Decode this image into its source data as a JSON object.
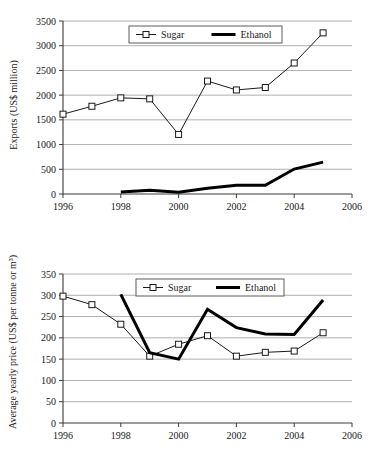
{
  "figure": {
    "title": "",
    "charts": [
      {
        "id": "exports",
        "name": "Sugar and ethanol exports"
      },
      {
        "id": "prices",
        "name": "Sugar and ethanol average yearly price"
      }
    ]
  },
  "chart_data": [
    {
      "type": "line",
      "title": "",
      "xlabel": "",
      "ylabel": "Exports (US$ million)",
      "x": [
        1996,
        1997,
        1998,
        1999,
        2000,
        2001,
        2002,
        2003,
        2004,
        2005
      ],
      "xlim": [
        1996,
        2006
      ],
      "ylim": [
        0,
        3500
      ],
      "xticks": [
        1996,
        1998,
        2000,
        2002,
        2004,
        2006
      ],
      "xticklabels": [
        "1996",
        "1998",
        "2000",
        "2002",
        "2004",
        "2006"
      ],
      "yticks": [
        0,
        500,
        1000,
        1500,
        2000,
        2500,
        3000,
        3500
      ],
      "yticklabels": [
        "0",
        "500",
        "1000",
        "1500",
        "2000",
        "2500",
        "3000",
        "3500"
      ],
      "grid": true,
      "legend_position": "top-center",
      "series": [
        {
          "name": "Sugar",
          "marker": "square",
          "x": [
            1996,
            1997,
            1998,
            1999,
            2000,
            2001,
            2002,
            2003,
            2004,
            2005
          ],
          "values": [
            1615,
            1775,
            1945,
            1925,
            1205,
            2285,
            2105,
            2155,
            2650,
            3260
          ]
        },
        {
          "name": "Ethanol",
          "marker": "none",
          "x": [
            1998,
            1999,
            2000,
            2001,
            2002,
            2003,
            2004,
            2005
          ],
          "values": [
            40,
            75,
            35,
            115,
            175,
            175,
            505,
            645
          ]
        }
      ]
    },
    {
      "type": "line",
      "title": "",
      "xlabel": "",
      "ylabel": "Average yearly price (US$ per tonne or m³)",
      "x": [
        1996,
        1997,
        1998,
        1999,
        2000,
        2001,
        2002,
        2003,
        2004,
        2005
      ],
      "xlim": [
        1996,
        2006
      ],
      "ylim": [
        0,
        350
      ],
      "xticks": [
        1996,
        1998,
        2000,
        2002,
        2004,
        2006
      ],
      "xticklabels": [
        "1996",
        "1998",
        "2000",
        "2002",
        "2004",
        "2006"
      ],
      "yticks": [
        0,
        50,
        100,
        150,
        200,
        250,
        300,
        350
      ],
      "yticklabels": [
        "0",
        "50",
        "100",
        "150",
        "200",
        "250",
        "300",
        "350"
      ],
      "grid": true,
      "legend_position": "top-center",
      "series": [
        {
          "name": "Sugar",
          "marker": "square",
          "x": [
            1996,
            1997,
            1998,
            1999,
            2000,
            2001,
            2002,
            2003,
            2004,
            2005
          ],
          "values": [
            298,
            278,
            232,
            157,
            185,
            205,
            157,
            166,
            169,
            212
          ]
        },
        {
          "name": "Ethanol",
          "marker": "none",
          "x": [
            1998,
            1999,
            2000,
            2001,
            2002,
            2003,
            2004,
            2005
          ],
          "values": [
            302,
            165,
            150,
            267,
            224,
            209,
            208,
            289
          ]
        }
      ]
    }
  ],
  "legend": {
    "sugar_label": "Sugar",
    "ethanol_label": "Ethanol"
  },
  "colors": {
    "sugar": "#1a1a1a",
    "ethanol": "#000000",
    "grid": "#9a9a9a",
    "axis": "#3a3a3a",
    "background": "#ffffff"
  }
}
